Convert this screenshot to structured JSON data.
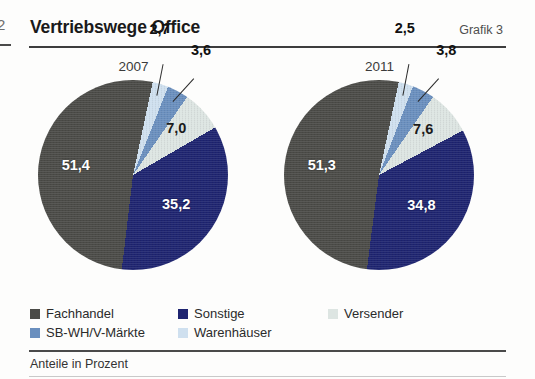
{
  "page": {
    "folio": "2",
    "title": "Vertriebswege Office",
    "figure_number": "Grafik 3",
    "footnote": "Anteile in Prozent"
  },
  "colors": {
    "fachhandel": "#4b4b47",
    "sonstige": "#1e2470",
    "versender": "#dde5e2",
    "sb_wh_v_maerkte": "#6a8fbe",
    "warenhaeuser": "#cfe0ef",
    "rule_dark": "#3d3d3d",
    "rule_light": "#c9c9c9",
    "text": "#1a1a1a"
  },
  "legend": {
    "items": [
      {
        "label": "Fachhandel",
        "color_key": "fachhandel",
        "swatch": "#4b4b47"
      },
      {
        "label": "Sonstige",
        "color_key": "sonstige",
        "swatch": "#1e2470"
      },
      {
        "label": "Versender",
        "color_key": "versender",
        "swatch": "#dde5e2"
      },
      {
        "label": "SB-WH/V-Märkte",
        "color_key": "sb_wh_v_maerkte",
        "swatch": "#6a8fbe"
      },
      {
        "label": "Warenhäuser",
        "color_key": "warenhaeuser",
        "swatch": "#cfe0ef"
      }
    ]
  },
  "chart_data": [
    {
      "type": "pie",
      "title": "2007",
      "unit": "Prozent",
      "categories": [
        "Fachhandel",
        "Sonstige",
        "Versender",
        "SB-WH/V-Märkte",
        "Warenhäuser"
      ],
      "values": [
        51.4,
        35.2,
        7.0,
        3.6,
        2.7
      ],
      "labels": [
        "51,4",
        "35,2",
        "7,0",
        "3,6",
        "2,7"
      ],
      "colors": [
        "#4b4b47",
        "#1e2470",
        "#dde5e2",
        "#6a8fbe",
        "#cfe0ef"
      ]
    },
    {
      "type": "pie",
      "title": "2011",
      "unit": "Prozent",
      "categories": [
        "Fachhandel",
        "Sonstige",
        "Versender",
        "SB-WH/V-Märkte",
        "Warenhäuser"
      ],
      "values": [
        51.3,
        34.8,
        7.6,
        3.8,
        2.5
      ],
      "labels": [
        "51,3",
        "34,8",
        "7,6",
        "3,8",
        "2,5"
      ],
      "colors": [
        "#4b4b47",
        "#1e2470",
        "#dde5e2",
        "#6a8fbe",
        "#cfe0ef"
      ]
    }
  ]
}
